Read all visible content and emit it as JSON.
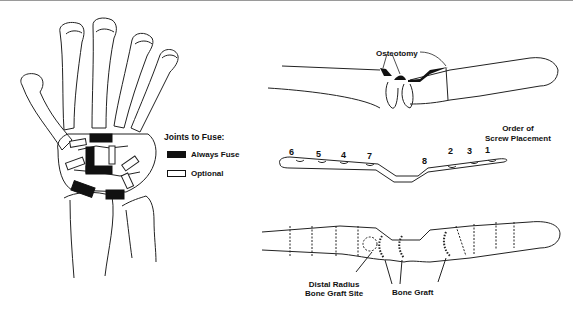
{
  "figure": {
    "legend": {
      "title": "Joints to Fuse:",
      "items": [
        {
          "label": "Always Fuse",
          "style": "filled",
          "color": "#111111"
        },
        {
          "label": "Optional",
          "style": "outline",
          "color": "#ffffff"
        }
      ]
    },
    "lateral_view": {
      "annotation": "Osteotomy"
    },
    "plate": {
      "caption_line1": "Order of",
      "caption_line2": "Screw Placement",
      "screw_numbers": [
        "6",
        "5",
        "4",
        "7",
        "8",
        "2",
        "3",
        "1"
      ]
    },
    "fixation_view": {
      "graft_site_line1": "Distal Radius",
      "graft_site_line2": "Bone Graft Site",
      "bone_graft": "Bone Graft"
    },
    "colors": {
      "ink": "#111111",
      "paper": "#ffffff"
    }
  }
}
